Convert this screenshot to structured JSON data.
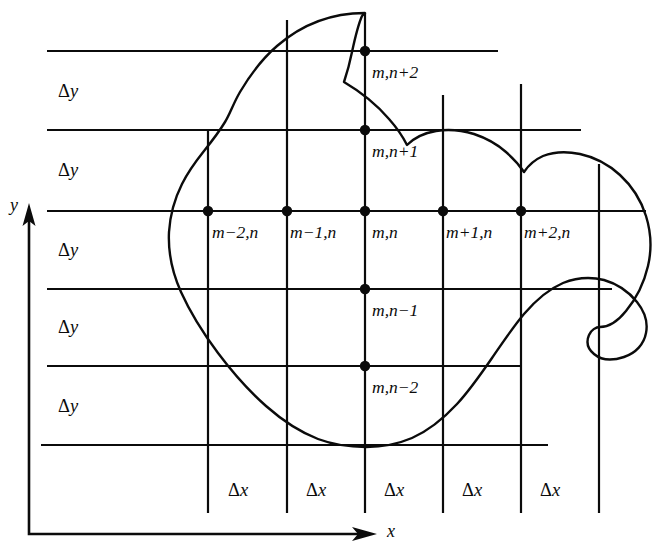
{
  "figure": {
    "type": "diagram",
    "width": 664,
    "height": 557,
    "background_color": "#ffffff",
    "line_color": "#0b0b0b"
  },
  "axes": {
    "y_axis": {
      "label": "y",
      "direction": "up",
      "x": 29,
      "tip_y": 213,
      "base_y": 534
    },
    "x_axis": {
      "label": "x",
      "direction": "right",
      "y": 534,
      "base_x": 29,
      "tip_x": 376
    }
  },
  "grid": {
    "vertical_lines_x": [
      208,
      287,
      365,
      443,
      521,
      599
    ],
    "horizontal_lines_y": [
      51,
      130,
      211,
      289,
      366,
      445
    ],
    "x_spacing_label": "Δx",
    "y_spacing_label": "Δy",
    "x_spacing_count": 5,
    "y_spacing_count": 5
  },
  "spacing_labels": {
    "delta_y": [
      {
        "text_delta": "Δ",
        "text_var": "y",
        "x": 58,
        "y": 82
      },
      {
        "text_delta": "Δ",
        "text_var": "y",
        "x": 58,
        "y": 161
      },
      {
        "text_delta": "Δ",
        "text_var": "y",
        "x": 58,
        "y": 241
      },
      {
        "text_delta": "Δ",
        "text_var": "y",
        "x": 58,
        "y": 318
      },
      {
        "text_delta": "Δ",
        "text_var": "y",
        "x": 58,
        "y": 397
      }
    ],
    "delta_x": [
      {
        "text_delta": "Δ",
        "text_var": "x",
        "x": 228,
        "y": 481
      },
      {
        "text_delta": "Δ",
        "text_var": "x",
        "x": 306,
        "y": 481
      },
      {
        "text_delta": "Δ",
        "text_var": "x",
        "x": 384,
        "y": 481
      },
      {
        "text_delta": "Δ",
        "text_var": "x",
        "x": 462,
        "y": 481
      },
      {
        "text_delta": "Δ",
        "text_var": "x",
        "x": 540,
        "y": 481
      }
    ]
  },
  "nodes": [
    {
      "id": "m-2,n",
      "label": "m−2,n",
      "x": 208,
      "y": 211,
      "label_x": 212,
      "label_y": 224
    },
    {
      "id": "m-1,n",
      "label": "m−1,n",
      "x": 287,
      "y": 211,
      "label_x": 290,
      "label_y": 224
    },
    {
      "id": "m,n",
      "label": "m,n",
      "x": 365,
      "y": 211,
      "label_x": 372,
      "label_y": 224
    },
    {
      "id": "m+1,n",
      "label": "m+1,n",
      "x": 443,
      "y": 211,
      "label_x": 446,
      "label_y": 224
    },
    {
      "id": "m+2,n",
      "label": "m+2,n",
      "x": 521,
      "y": 211,
      "label_x": 524,
      "label_y": 224
    },
    {
      "id": "m,n+2",
      "label": "m,n+2",
      "x": 365,
      "y": 51,
      "label_x": 372,
      "label_y": 64
    },
    {
      "id": "m,n+1",
      "label": "m,n+1",
      "x": 365,
      "y": 130,
      "label_x": 372,
      "label_y": 143
    },
    {
      "id": "m,n-1",
      "label": "m,n−1",
      "x": 365,
      "y": 289,
      "label_x": 372,
      "label_y": 302
    },
    {
      "id": "m,n-2",
      "label": "m,n−2",
      "x": 365,
      "y": 366,
      "label_x": 372,
      "label_y": 379
    }
  ],
  "boundary": {
    "description": "closed irregular curve enclosing the grid region",
    "closed": true
  }
}
